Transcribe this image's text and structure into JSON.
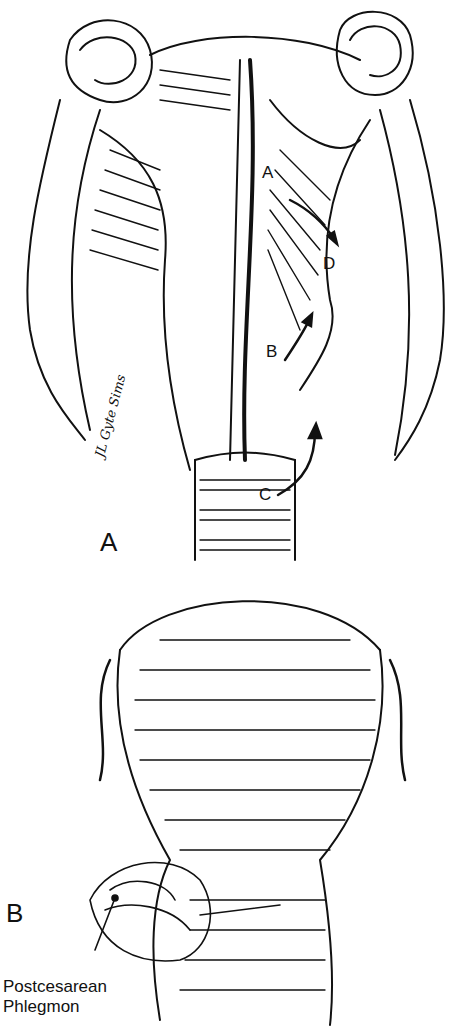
{
  "figure": {
    "panels": [
      {
        "id": "A",
        "label": "A",
        "subject": "opened uterus and cervix with adnexa"
      },
      {
        "id": "B",
        "label": "B",
        "subject": "uterus with postcesarean phlegmon"
      }
    ],
    "panel_a_labels": {
      "a": "A",
      "b": "B",
      "c": "C",
      "d": "D"
    },
    "panel_b_caption": [
      "Postcesarean",
      "Phlegmon"
    ],
    "signature": "JL Gyte Sims"
  }
}
